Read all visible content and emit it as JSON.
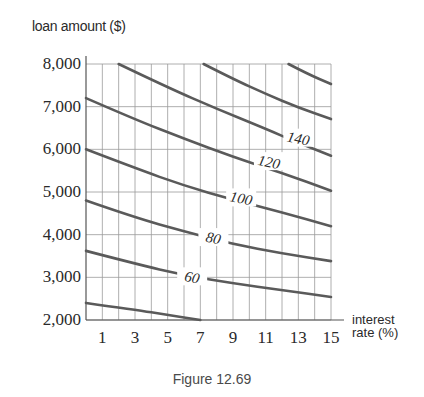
{
  "chart_data": {
    "type": "line",
    "title": "",
    "caption": "Figure 12.69",
    "xlabel": "interest rate (%)",
    "ylabel": "loan amount ($)",
    "xlim": [
      0,
      15
    ],
    "ylim": [
      2000,
      8000
    ],
    "grid": true,
    "x_ticks": [
      1,
      3,
      5,
      7,
      9,
      11,
      13,
      15
    ],
    "x_tick_labels": [
      "1",
      "3",
      "5",
      "7",
      "9",
      "11",
      "13",
      "15"
    ],
    "y_ticks": [
      2000,
      3000,
      4000,
      5000,
      6000,
      7000,
      8000
    ],
    "y_tick_labels": [
      "2,000",
      "3,000",
      "4,000",
      "5,000",
      "6,000",
      "7,000",
      "8,000"
    ],
    "contour_lines": [
      {
        "name": "40",
        "labeled": false,
        "points": [
          [
            0,
            2400
          ],
          [
            3,
            2240
          ],
          [
            5,
            2120
          ],
          [
            7,
            2000
          ]
        ]
      },
      {
        "name": "60",
        "labeled": true,
        "label_at": [
          6.5,
          3000
        ],
        "points": [
          [
            0,
            3620
          ],
          [
            3,
            3320
          ],
          [
            6,
            3050
          ],
          [
            9,
            2860
          ],
          [
            12,
            2700
          ],
          [
            15,
            2540
          ]
        ]
      },
      {
        "name": "80",
        "labeled": true,
        "label_at": [
          7.8,
          3920
        ],
        "points": [
          [
            0,
            4800
          ],
          [
            3,
            4400
          ],
          [
            6,
            4080
          ],
          [
            9,
            3780
          ],
          [
            12,
            3560
          ],
          [
            15,
            3380
          ]
        ]
      },
      {
        "name": "100",
        "labeled": true,
        "label_at": [
          9.5,
          4850
        ],
        "points": [
          [
            0,
            6000
          ],
          [
            3,
            5560
          ],
          [
            6,
            5150
          ],
          [
            9,
            4820
          ],
          [
            12,
            4520
          ],
          [
            15,
            4200
          ]
        ]
      },
      {
        "name": "120",
        "labeled": true,
        "label_at": [
          11.2,
          5700
        ],
        "points": [
          [
            0,
            7200
          ],
          [
            3,
            6700
          ],
          [
            6,
            6250
          ],
          [
            9,
            5820
          ],
          [
            12,
            5450
          ],
          [
            15,
            5030
          ]
        ]
      },
      {
        "name": "140",
        "labeled": true,
        "label_at": [
          13.0,
          6250
        ],
        "points": [
          [
            2,
            8000
          ],
          [
            5,
            7450
          ],
          [
            8,
            6950
          ],
          [
            11,
            6480
          ],
          [
            13,
            6150
          ],
          [
            15,
            5850
          ]
        ]
      },
      {
        "name": "160",
        "labeled": false,
        "points": [
          [
            7.2,
            8000
          ],
          [
            9,
            7650
          ],
          [
            11,
            7300
          ],
          [
            13,
            6980
          ],
          [
            15,
            6710
          ]
        ]
      },
      {
        "name": "180",
        "labeled": false,
        "points": [
          [
            12.4,
            8000
          ],
          [
            13.5,
            7780
          ],
          [
            15,
            7530
          ]
        ]
      }
    ],
    "legend": "none (lines labeled inline)"
  },
  "labels": {
    "y_title": "loan amount ($)",
    "x_title_line1": "interest",
    "x_title_line2": "rate (%)",
    "caption": "Figure 12.69"
  },
  "colors": {
    "curve": "#5a5a5a",
    "grid": "#9a9a9a",
    "axis": "#555555",
    "text": "#2a2a2a"
  }
}
